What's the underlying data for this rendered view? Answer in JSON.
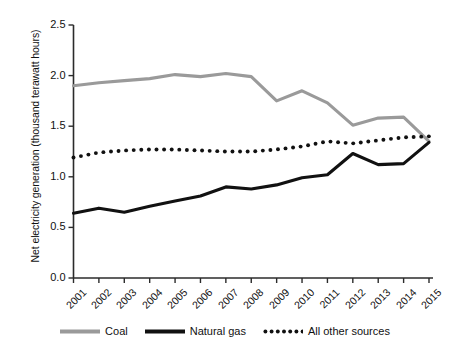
{
  "chart_data": {
    "type": "line",
    "title": "",
    "subtitle": "",
    "xlabel": "",
    "ylabel": "Net electricity generation (thousand terawatt hours)",
    "categories": [
      "2001",
      "2002",
      "2003",
      "2004",
      "2005",
      "2006",
      "2007",
      "2008",
      "2009",
      "2010",
      "2011",
      "2012",
      "2013",
      "2014",
      "2015"
    ],
    "x": [
      2001,
      2002,
      2003,
      2004,
      2005,
      2006,
      2007,
      2008,
      2009,
      2010,
      2011,
      2012,
      2013,
      2014,
      2015
    ],
    "series": [
      {
        "name": "Coal",
        "color": "#9a9a9a",
        "style": "solid",
        "values": [
          1.9,
          1.93,
          1.95,
          1.97,
          2.01,
          1.99,
          2.02,
          1.99,
          1.75,
          1.85,
          1.73,
          1.51,
          1.58,
          1.59,
          1.35
        ]
      },
      {
        "name": "Natural gas",
        "color": "#111111",
        "style": "solid",
        "values": [
          0.64,
          0.69,
          0.65,
          0.71,
          0.76,
          0.81,
          0.9,
          0.88,
          0.92,
          0.99,
          1.02,
          1.23,
          1.12,
          1.13,
          1.34
        ]
      },
      {
        "name": "All other sources",
        "color": "#111111",
        "style": "dotted",
        "values": [
          1.19,
          1.24,
          1.26,
          1.27,
          1.27,
          1.26,
          1.25,
          1.25,
          1.27,
          1.3,
          1.35,
          1.33,
          1.36,
          1.39,
          1.4
        ]
      }
    ],
    "ylim": [
      0.0,
      2.5
    ],
    "yticks": [
      "0.0",
      "0.5",
      "1.0",
      "1.5",
      "2.0",
      "2.5"
    ],
    "ytick_values": [
      0.0,
      0.5,
      1.0,
      1.5,
      2.0,
      2.5
    ],
    "grid": false,
    "legend_position": "bottom",
    "xtick_rotation": -45
  },
  "axis": {
    "y_label": "Net electricity generation (thousand terawatt hours)"
  },
  "legend": {
    "items": [
      {
        "label": "Coal"
      },
      {
        "label": "Natural gas"
      },
      {
        "label": "All other sources"
      }
    ]
  }
}
